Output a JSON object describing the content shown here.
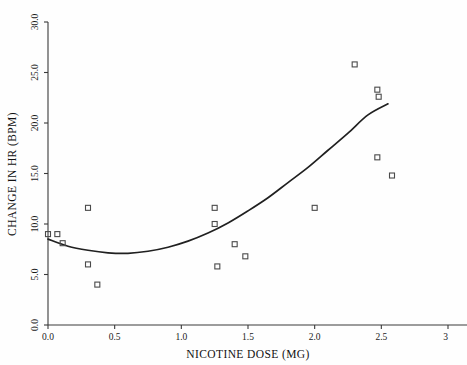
{
  "chart_data": {
    "type": "scatter",
    "title": "",
    "xlabel": "NICOTINE DOSE (MG)",
    "ylabel": "CHANGE IN HR (BPM)",
    "xlim": [
      0.0,
      3.0
    ],
    "ylim": [
      0.0,
      30.0
    ],
    "grid": false,
    "legend": null,
    "x_ticks": [
      0.0,
      0.5,
      1.0,
      1.5,
      2.0,
      2.5,
      3.0
    ],
    "x_tick_labels": [
      "0.0",
      "0.5",
      "1.0",
      "1.5",
      "2.0",
      "2.5",
      "3"
    ],
    "y_ticks": [
      0.0,
      5.0,
      10.0,
      15.0,
      20.0,
      25.0,
      30.0
    ],
    "y_tick_labels": [
      "0.0",
      "5.0",
      "10.0",
      "15.0",
      "20.0",
      "25.0",
      "30.0"
    ],
    "marker_style": "open-square",
    "series": [
      {
        "name": "observations",
        "type": "scatter",
        "points": [
          [
            0.0,
            9.0
          ],
          [
            0.07,
            9.0
          ],
          [
            0.11,
            8.1
          ],
          [
            0.3,
            11.6
          ],
          [
            0.3,
            6.0
          ],
          [
            0.37,
            4.0
          ],
          [
            1.25,
            11.6
          ],
          [
            1.25,
            10.0
          ],
          [
            1.27,
            5.8
          ],
          [
            1.4,
            8.0
          ],
          [
            1.48,
            6.8
          ],
          [
            2.0,
            11.6
          ],
          [
            2.3,
            25.8
          ],
          [
            2.47,
            23.3
          ],
          [
            2.48,
            22.6
          ],
          [
            2.47,
            16.6
          ],
          [
            2.58,
            14.8
          ]
        ]
      },
      {
        "name": "quadratic-fit",
        "type": "line",
        "points": [
          [
            0.0,
            8.5
          ],
          [
            0.15,
            7.8
          ],
          [
            0.3,
            7.4
          ],
          [
            0.45,
            7.15
          ],
          [
            0.6,
            7.1
          ],
          [
            0.75,
            7.3
          ],
          [
            0.9,
            7.7
          ],
          [
            1.05,
            8.3
          ],
          [
            1.2,
            9.1
          ],
          [
            1.35,
            10.1
          ],
          [
            1.5,
            11.3
          ],
          [
            1.65,
            12.6
          ],
          [
            1.8,
            14.1
          ],
          [
            1.95,
            15.6
          ],
          [
            2.1,
            17.3
          ],
          [
            2.25,
            19.0
          ],
          [
            2.4,
            20.8
          ],
          [
            2.55,
            21.9
          ]
        ]
      }
    ]
  },
  "axes_geometry": {
    "left_px": 48,
    "right_px": 448,
    "bottom_px": 325,
    "top_px": 22
  }
}
